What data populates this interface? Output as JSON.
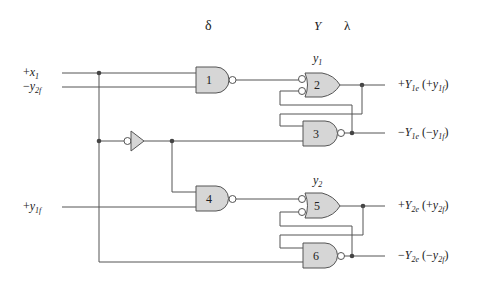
{
  "diagram": {
    "type": "logic-circuit",
    "header_labels": {
      "delta": "δ",
      "Y": "Y",
      "lambda": "λ"
    },
    "latch_labels": {
      "y1": {
        "base": "y",
        "sub": "1"
      },
      "y2": {
        "base": "y",
        "sub": "2"
      }
    },
    "inputs": [
      {
        "id": "x1",
        "sign": "+",
        "base": "x",
        "sub": "1"
      },
      {
        "id": "y2f",
        "sign": "−",
        "base": "y",
        "sub": "2f"
      },
      {
        "id": "y1f",
        "sign": "+",
        "base": "y",
        "sub": "1f"
      }
    ],
    "outputs": [
      {
        "id": "Y1e_pos",
        "sign": "+",
        "base": "Y",
        "sub": "1e",
        "paren_sign": "+",
        "paren_base": "y",
        "paren_sub": "1f"
      },
      {
        "id": "Y1e_neg",
        "sign": "−",
        "base": "Y",
        "sub": "1e",
        "paren_sign": "−",
        "paren_base": "y",
        "paren_sub": "1f"
      },
      {
        "id": "Y2e_pos",
        "sign": "+",
        "base": "Y",
        "sub": "2e",
        "paren_sign": "+",
        "paren_base": "y",
        "paren_sub": "2f"
      },
      {
        "id": "Y2e_neg",
        "sign": "−",
        "base": "Y",
        "sub": "2e",
        "paren_sign": "−",
        "paren_base": "y",
        "paren_sub": "2f"
      }
    ],
    "gates": [
      {
        "num": "1",
        "type": "NAND"
      },
      {
        "num": "2",
        "type": "OR (inverted inputs)"
      },
      {
        "num": "3",
        "type": "NAND"
      },
      {
        "num": "4",
        "type": "NAND"
      },
      {
        "num": "5",
        "type": "OR (inverted inputs)"
      },
      {
        "num": "6",
        "type": "NAND"
      }
    ],
    "inverter": {
      "type": "buffer with inverted input"
    }
  }
}
